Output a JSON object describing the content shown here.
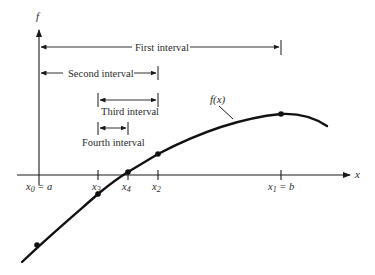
{
  "figure": {
    "axes": {
      "y_label": "f",
      "x_label": "x"
    },
    "intervals": [
      {
        "label": "First interval",
        "from": "x0",
        "to": "x1"
      },
      {
        "label": "Second interval",
        "from": "x0",
        "to": "x2"
      },
      {
        "label": "Third interval",
        "from": "x3",
        "to": "x2"
      },
      {
        "label": "Fourth interval",
        "from": "x3",
        "to": "x4"
      }
    ],
    "ticks": [
      {
        "id": "x0",
        "label_main": "x",
        "label_sub": "0",
        "label_suffix": " = a"
      },
      {
        "id": "x3",
        "label_main": "x",
        "label_sub": "3",
        "label_suffix": ""
      },
      {
        "id": "x4",
        "label_main": "x",
        "label_sub": "4",
        "label_suffix": ""
      },
      {
        "id": "x2",
        "label_main": "x",
        "label_sub": "2",
        "label_suffix": ""
      },
      {
        "id": "x1",
        "label_main": "x",
        "label_sub": "1",
        "label_suffix": " = b"
      }
    ],
    "curve_label": "f(x)",
    "colors": {
      "ink": "#1a1a1a",
      "background": "#ffffff"
    }
  }
}
